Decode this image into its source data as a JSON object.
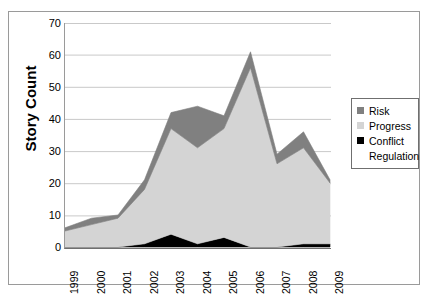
{
  "chart_data": {
    "type": "area",
    "stacked": true,
    "title": "",
    "xlabel": "",
    "ylabel": "Story Count",
    "categories": [
      "1999",
      "2000",
      "2001",
      "2002",
      "2003",
      "2004",
      "2005",
      "2006",
      "2007",
      "2008",
      "2009"
    ],
    "ylim": [
      0,
      70
    ],
    "yticks": [
      0,
      10,
      20,
      30,
      40,
      50,
      60,
      70
    ],
    "grid": true,
    "legend_position": "right",
    "series": [
      {
        "name": "Conflict",
        "color": "#000000",
        "values": [
          0,
          0,
          0,
          1,
          4,
          1,
          3,
          0,
          0,
          1,
          1
        ]
      },
      {
        "name": "Progress",
        "color": "#d4d4d4",
        "values": [
          5,
          7,
          9,
          17,
          33,
          30,
          34,
          56,
          26,
          30,
          19
        ]
      },
      {
        "name": "Risk",
        "color": "#808080",
        "values": [
          1,
          2,
          1,
          3,
          5,
          13,
          4,
          5,
          3,
          5,
          1
        ]
      },
      {
        "name": "Regulation",
        "color": "#ffffff",
        "values": [
          0,
          0,
          0,
          0,
          0,
          0,
          0,
          0,
          0,
          0,
          0
        ]
      }
    ],
    "totals": [
      6,
      9,
      10,
      21,
      42,
      44,
      41,
      61,
      29,
      36,
      21
    ]
  },
  "legend": {
    "items": [
      {
        "label": "Risk",
        "color": "#808080"
      },
      {
        "label": "Progress",
        "color": "#d4d4d4"
      },
      {
        "label": "Conflict",
        "color": "#000000"
      },
      {
        "label": "Regulation",
        "color": "#ffffff"
      }
    ]
  }
}
